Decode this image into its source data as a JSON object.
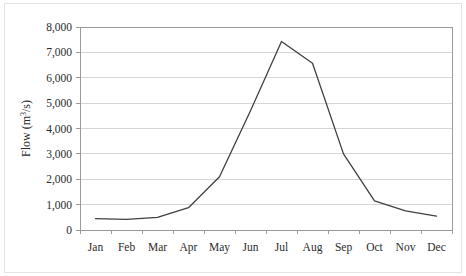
{
  "chart_data": {
    "type": "line",
    "title": "",
    "subtitle": "",
    "xlabel": "",
    "ylabel": "Flow (m3/s)",
    "ylabel_parts": {
      "prefix": "Flow (m",
      "superscript": "3",
      "suffix": "/s)"
    },
    "categories": [
      "Jan",
      "Feb",
      "Mar",
      "Apr",
      "May",
      "Jun",
      "Jul",
      "Aug",
      "Sep",
      "Oct",
      "Nov",
      "Dec"
    ],
    "series": [
      {
        "name": "Flow",
        "values": [
          450,
          420,
          500,
          880,
          2100,
          4700,
          7430,
          6570,
          3000,
          1150,
          750,
          550
        ],
        "color": "#404040"
      }
    ],
    "ylim": [
      0,
      8000
    ],
    "ytick_values": [
      0,
      1000,
      2000,
      3000,
      4000,
      5000,
      6000,
      7000,
      8000
    ],
    "ytick_labels": [
      "0",
      "1,000",
      "2,000",
      "3,000",
      "4,000",
      "5,000",
      "6,000",
      "7,000",
      "8,000"
    ],
    "grid": {
      "horizontal": true,
      "vertical": false,
      "color": "#d6d6d6"
    },
    "legend": {
      "visible": false,
      "position": "none"
    },
    "axis_color": "#9a9a9a",
    "plot_background": "#ffffff",
    "figure_background": "#ffffff"
  },
  "plot_geometry": {
    "left": 80,
    "top": 27,
    "right": 452,
    "bottom": 230
  }
}
